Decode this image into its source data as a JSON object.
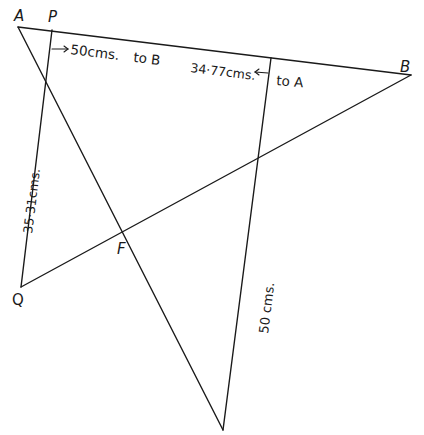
{
  "diagram": {
    "type": "geometric-construction",
    "stroke_color": "#1a1a1a",
    "background": "#ffffff",
    "points": {
      "A": {
        "label": "A",
        "x": 18,
        "y": 27
      },
      "P": {
        "label": "P",
        "x": 52,
        "y": 30
      },
      "B": {
        "label": "B",
        "x": 411,
        "y": 75
      },
      "Q": {
        "label": "Q",
        "x": 21,
        "y": 289
      },
      "F": {
        "label": "F",
        "x": 124,
        "y": 234
      },
      "R": {
        "x": 271,
        "y": 58
      },
      "Bottom": {
        "x": 223,
        "y": 430
      }
    },
    "lines": [
      {
        "name": "line-AB",
        "from": "A",
        "to": "B"
      },
      {
        "name": "line-PQ",
        "from": "P",
        "to": "Q"
      },
      {
        "name": "line-QB",
        "from": "Q",
        "to": "B"
      },
      {
        "name": "line-A-bottom",
        "from": "A",
        "to": "Bottom"
      },
      {
        "name": "line-R-bottom",
        "from": "R",
        "to": "Bottom"
      }
    ],
    "labels": {
      "vertex_A": "A",
      "vertex_P": "P",
      "vertex_B": "B",
      "vertex_Q": "Q",
      "vertex_F": "F",
      "arrow_to_B_measure": "50cms.",
      "arrow_to_B_dir": "to B",
      "arrow_to_A_measure": "34·77cms.",
      "arrow_to_A_dir": "to A",
      "pq_length": "35·31cms.",
      "right_vertical_length": "50 cms."
    }
  }
}
